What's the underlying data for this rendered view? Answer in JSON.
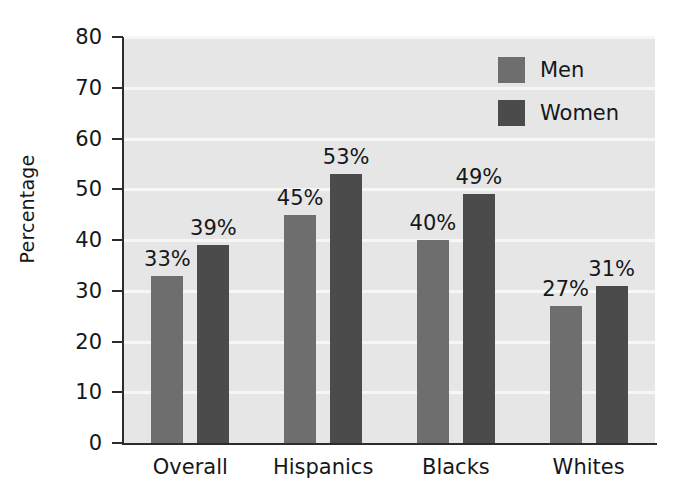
{
  "chart_data": {
    "type": "bar",
    "title": "",
    "xlabel": "",
    "ylabel": "Percentage",
    "categories": [
      "Overall",
      "Hispanics",
      "Blacks",
      "Whites"
    ],
    "series": [
      {
        "name": "Men",
        "values": [
          33,
          45,
          40,
          27
        ],
        "color": "#6e6e6e"
      },
      {
        "name": "Women",
        "values": [
          39,
          53,
          49,
          31
        ],
        "color": "#4b4b4b"
      }
    ],
    "value_labels": {
      "Men": [
        "33%",
        "45%",
        "40%",
        "27%"
      ],
      "Women": [
        "39%",
        "53%",
        "49%",
        "31%"
      ]
    },
    "ylim": [
      0,
      80
    ],
    "y_ticks": [
      0,
      10,
      20,
      30,
      40,
      50,
      60,
      70,
      80
    ],
    "y_tick_labels": [
      "0",
      "10",
      "20",
      "30",
      "40",
      "50",
      "60",
      "70",
      "80"
    ],
    "grid": true,
    "grid_color": "#f7f7f7",
    "plot_background": "#e6e6e6",
    "figure_background": "#ffffff",
    "legend_position": "top-right",
    "legend_entries": [
      "Men",
      "Women"
    ]
  },
  "axes": {
    "y_title": "Percentage"
  },
  "legend": {
    "items": [
      {
        "label": "Men",
        "swatch": "men-swatch"
      },
      {
        "label": "Women",
        "swatch": "women-swatch"
      }
    ]
  }
}
